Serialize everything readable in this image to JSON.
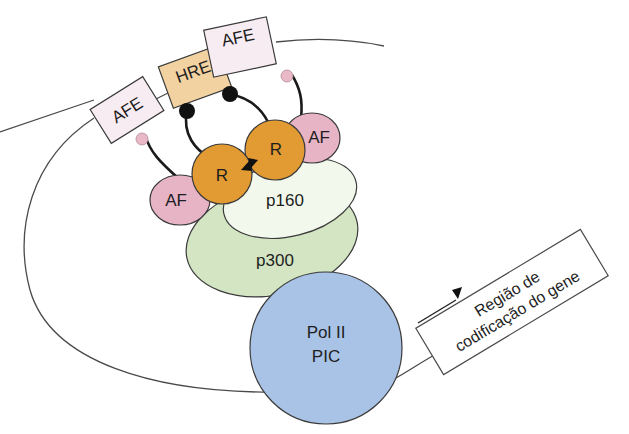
{
  "diagram": {
    "elements": {
      "afe_left": {
        "label": "AFE"
      },
      "hre": {
        "label": "HRE"
      },
      "afe_right": {
        "label": "AFE"
      },
      "af_left": {
        "label": "AF"
      },
      "af_right": {
        "label": "AF"
      },
      "receptor_left": {
        "label": "R"
      },
      "receptor_right": {
        "label": "R"
      },
      "p160": {
        "label": "p160"
      },
      "p300": {
        "label": "p300"
      },
      "pol2": {
        "line1": "Pol II",
        "line2": "PIC"
      },
      "gene_region": {
        "line1": "Região de",
        "line2": "codificação do gene"
      }
    },
    "colors": {
      "afe_fill": "#f8ecf3",
      "hre_fill": "#f3d2a2",
      "af_fill": "#e7b4c6",
      "receptor_fill": "#e29a32",
      "p160_fill": "#f2f8ec",
      "p300_fill": "#d3e5c2",
      "pol2_fill": "#a9c3e6",
      "dna_line": "#4a4a4a"
    }
  }
}
